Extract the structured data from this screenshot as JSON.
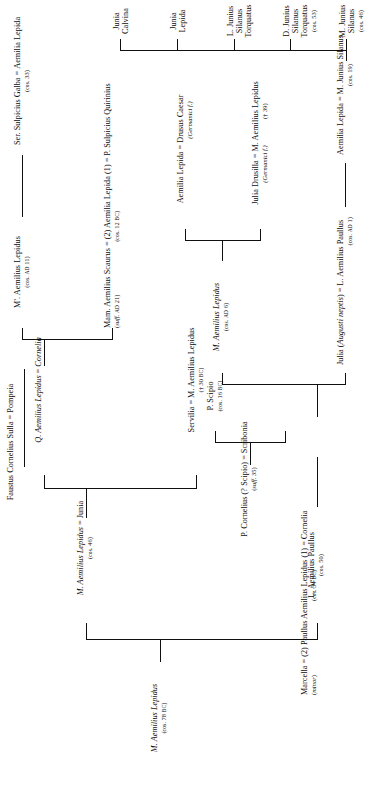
{
  "meta": {
    "orientation": "rotated-90-ccw",
    "page_width": 795,
    "page_height": 372,
    "line_color": "#101010",
    "text_color": "#0b0b0b",
    "background": "#ffffff"
  },
  "nodes": {
    "root": {
      "name": "M. Aemilius Lepidus",
      "note": "(cos. 78 BC)",
      "note_pre": "(",
      "note_sc": "cos.",
      "note_mid": " 78 ",
      "note_sc2": "BC",
      "note_post": ")"
    },
    "lepidus_cos46": {
      "name": "M. Aemilius Lepidus",
      "spouse": "Junia",
      "eq": "=",
      "note": "(cos. 46)"
    },
    "paullus_cos50": {
      "name": "L. Aemilius Paullus",
      "note": "(cos. 50)"
    },
    "faustus_sulla": {
      "name": "Faustus Cornelius Sulla",
      "spouse": "Pompeia",
      "eq": "="
    },
    "q_aemilius_lepidus": {
      "name": "Q. Aemilius Lepidus",
      "spouse": "Cornelia",
      "eq": "="
    },
    "servilia_lepidus": {
      "name": "Servilia",
      "spouse": "M. Aemilius Lepidus",
      "eq": "=",
      "note": "(† 30 BC)"
    },
    "man_aemilius_scaurus": {
      "name": "Mam. Aemilius Scaurus",
      "note": "(suff. AD 21)",
      "marriage_label_2": "(2)",
      "marriage_label_1": "(1)",
      "wife": "Aemilia Lepida",
      "wife2_husband": "P. Sulpicius Quirinius",
      "wife2_note": "(cos. 12 BC)"
    },
    "mn_aemilius_lepidus_ad11": {
      "name": "M'. Aemilius Lepidus",
      "note": "(cos. AD 11)"
    },
    "galba_aemilia_lepida": {
      "name": "Ser. Sulpicius Galba",
      "spouse": "Aemilia Lepida",
      "eq": "=",
      "note": "(cos. 33)"
    },
    "p_cornelius_scribonia": {
      "name": "P. Cornelius (? Scipio)",
      "spouse": "Scribonia",
      "eq": "=",
      "note": "(suff. 35)"
    },
    "p_scipio": {
      "name": "P. Scipio",
      "note": "(cos. 16 BC)"
    },
    "paullus_lepidus_cornelia": {
      "name": "Paullus Aemilius Lepidus (1)",
      "spouse": "Cornelia",
      "eq": "=",
      "note": "(cos. 34 BC)",
      "marriage_label": "(2)",
      "wife2": "Marcella",
      "wife2_note": "(minor)"
    },
    "lepidus_cos_ad6": {
      "name": "M. Aemilius Lepidus",
      "note": "(cos. AD 6)"
    },
    "l_aemilius_paullus": {
      "name": "L. Aemilius Paullus",
      "spouse": "Julia (Augusti neptis)",
      "eq": "=",
      "note": "(cos. AD 1)"
    },
    "julia_drusilla_lepidus": {
      "name": "Julia Drusilla",
      "name_note": "(Germanici f.)",
      "spouse": "M. Aemilius Lepidus",
      "eq": "=",
      "note": "(† 39)"
    },
    "aemilia_lepida_drusus": {
      "name": "Aemilia Lepida",
      "spouse": "Drusus Caesar",
      "eq": "=",
      "spouse_note": "(Germanici f.)"
    },
    "aemilia_lepida_silanus": {
      "name": "Aemilia Lepida",
      "spouse": "M. Junius Silanus",
      "eq": "=",
      "note": "(cos. 19)"
    },
    "m_junius_silanus": {
      "name": "M. Junius Silanus",
      "note": "(cos. 46)"
    },
    "d_junius_silanus_torquatus": {
      "name": "D. Junius Silanus Torquatus",
      "note": "(cos. 53)"
    },
    "l_junius_silanus_torquatus": {
      "name": "L. Junius Silanus Torquatus",
      "note": ""
    },
    "junia_lepida": {
      "name": "Junia Lepida",
      "note": ""
    },
    "junia_calvina": {
      "name": "Junia Calvina",
      "note": ""
    }
  }
}
